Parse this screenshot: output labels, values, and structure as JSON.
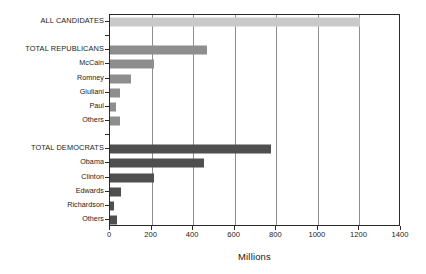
{
  "chart_data": {
    "type": "bar",
    "orientation": "horizontal",
    "title": "",
    "xlabel": "Millions",
    "ylabel": "",
    "xlim": [
      0,
      1400
    ],
    "xticks": [
      0,
      200,
      400,
      600,
      800,
      1000,
      1200,
      1400
    ],
    "xticklabels": [
      "0",
      "200",
      "400",
      "600",
      "800",
      "1000",
      "1200",
      "1400"
    ],
    "grid": "vertical",
    "legend": "none",
    "categories": [
      "ALL CANDIDATES",
      "",
      "TOTAL REPUBLICANS",
      "McCain",
      "Romney",
      "Giuliani",
      "Paul",
      "Others",
      "",
      "TOTAL DEMOCRATS",
      "Obama",
      "Clinton",
      "Edwards",
      "Richardson",
      "Others"
    ],
    "values": [
      1205,
      null,
      465,
      210,
      100,
      50,
      28,
      50,
      null,
      775,
      452,
      212,
      52,
      20,
      35
    ],
    "bars": [
      {
        "label": "ALL CANDIDATES",
        "value": 1205,
        "group": "all",
        "color": "#c9c9c9",
        "emphasis": true
      },
      {
        "label": "",
        "value": null,
        "group": "gap",
        "color": "",
        "emphasis": false
      },
      {
        "label": "TOTAL REPUBLICANS",
        "value": 465,
        "group": "republican",
        "color": "#8e8e8e",
        "emphasis": true
      },
      {
        "label": "McCain",
        "value": 210,
        "group": "republican",
        "color": "#8e8e8e",
        "emphasis": false
      },
      {
        "label": "Romney",
        "value": 100,
        "group": "republican",
        "color": "#8e8e8e",
        "emphasis": false
      },
      {
        "label": "Giuliani",
        "value": 50,
        "group": "republican",
        "color": "#8e8e8e",
        "emphasis": false
      },
      {
        "label": "Paul",
        "value": 28,
        "group": "republican",
        "color": "#8e8e8e",
        "emphasis": false
      },
      {
        "label": "Others",
        "value": 50,
        "group": "republican",
        "color": "#8e8e8e",
        "emphasis": false
      },
      {
        "label": "",
        "value": null,
        "group": "gap",
        "color": "",
        "emphasis": false
      },
      {
        "label": "TOTAL DEMOCRATS",
        "value": 775,
        "group": "democrat",
        "color": "#4f4f4f",
        "emphasis": true
      },
      {
        "label": "Obama",
        "value": 452,
        "group": "democrat",
        "color": "#4f4f4f",
        "emphasis": false
      },
      {
        "label": "Clinton",
        "value": 212,
        "group": "democrat",
        "color": "#4f4f4f",
        "emphasis": false
      },
      {
        "label": "Edwards",
        "value": 52,
        "group": "democrat",
        "color": "#4f4f4f",
        "emphasis": false
      },
      {
        "label": "Richardson",
        "value": 20,
        "group": "democrat",
        "color": "#4f4f4f",
        "emphasis": false
      },
      {
        "label": "Others",
        "value": 35,
        "group": "democrat",
        "color": "#4f4f4f",
        "emphasis": false
      }
    ],
    "colors": {
      "all_candidates": "#c9c9c9",
      "republicans": "#8e8e8e",
      "democrats": "#4f4f4f",
      "axis": "#2a2a2a",
      "gridline": "#8d8d8d",
      "background": "#ffffff"
    }
  }
}
